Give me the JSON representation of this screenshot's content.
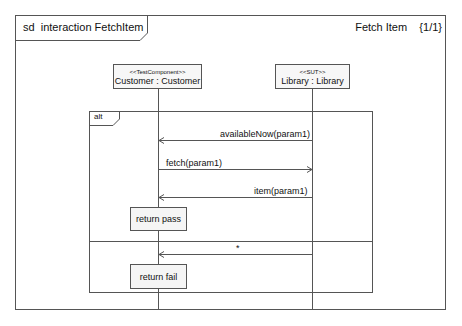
{
  "frame": {
    "kind": "sd",
    "title": "interaction FetchItem",
    "diagram_name": "Fetch Item",
    "page": "{1/1}"
  },
  "lifelines": [
    {
      "stereotype": "<<TestComponent>>",
      "name": "Customer : Customer"
    },
    {
      "stereotype": "<<SUT>>",
      "name": "Library : Library"
    }
  ],
  "fragment": {
    "operator": "alt",
    "operands": [
      {
        "messages": [
          {
            "label": "availableNow(param1)",
            "from": "Library",
            "to": "Customer"
          },
          {
            "label": "fetch(param1)",
            "from": "Customer",
            "to": "Library"
          },
          {
            "label": "item(param1)",
            "from": "Library",
            "to": "Customer"
          }
        ],
        "action": "return pass"
      },
      {
        "messages": [
          {
            "label": "*",
            "from": "Library",
            "to": "Customer"
          }
        ],
        "action": "return fail"
      }
    ]
  },
  "colors": {
    "line": "#555555",
    "box_fill": "#f7f7f7",
    "background": "#ffffff"
  }
}
